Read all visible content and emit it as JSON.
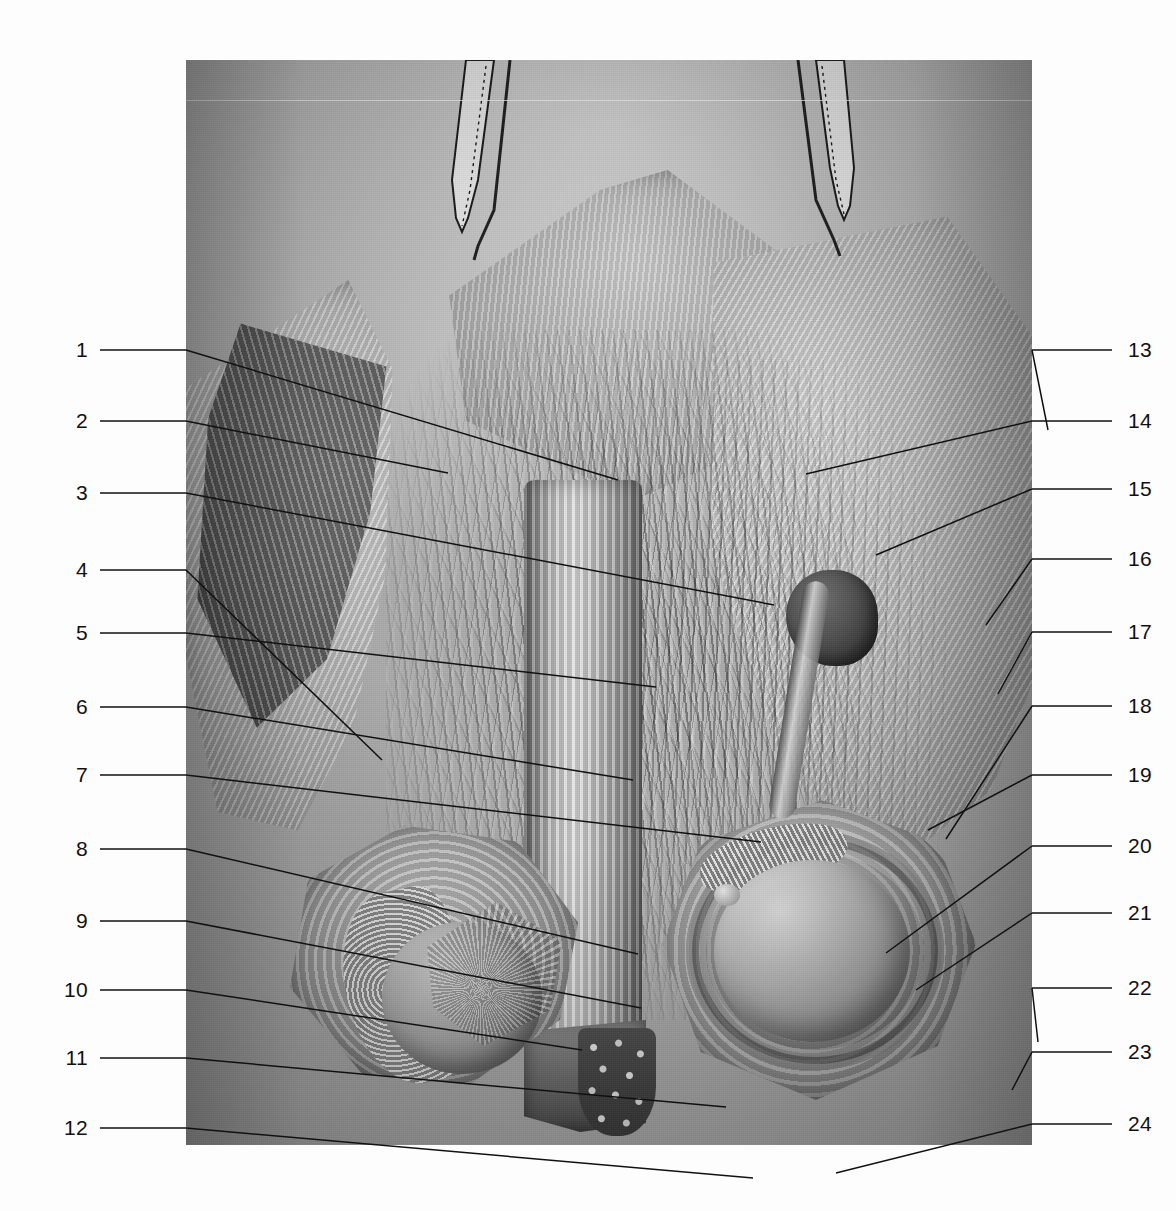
{
  "figure": {
    "frame": {
      "left": 186,
      "top": 60,
      "width": 846,
      "height": 1085
    },
    "background_color": "#b9b9b9",
    "page_background": "#fdfdfd",
    "line_color": "#111111"
  },
  "labels": {
    "left": [
      {
        "n": "1",
        "y": 350,
        "tip_x": 432,
        "tip_y": 420
      },
      {
        "n": "2",
        "y": 421,
        "tip_x": 262,
        "tip_y": 413
      },
      {
        "n": "3",
        "y": 493,
        "tip_x": 588,
        "tip_y": 545
      },
      {
        "n": "4",
        "y": 570,
        "tip_x": 196,
        "tip_y": 700
      },
      {
        "n": "5",
        "y": 633,
        "tip_x": 470,
        "tip_y": 627
      },
      {
        "n": "6",
        "y": 707,
        "tip_x": 447,
        "tip_y": 720
      },
      {
        "n": "7",
        "y": 775,
        "tip_x": 575,
        "tip_y": 782
      },
      {
        "n": "8",
        "y": 849,
        "tip_x": 452,
        "tip_y": 894
      },
      {
        "n": "9",
        "y": 921,
        "tip_x": 455,
        "tip_y": 948
      },
      {
        "n": "10",
        "y": 990,
        "tip_x": 396,
        "tip_y": 990
      },
      {
        "n": "11",
        "y": 1058,
        "tip_x": 540,
        "tip_y": 1047
      },
      {
        "n": "12",
        "y": 1128,
        "tip_x": 567,
        "tip_y": 1118
      }
    ],
    "right": [
      {
        "n": "13",
        "y": 350,
        "tip_x": 862,
        "tip_y": 370
      },
      {
        "n": "14",
        "y": 421,
        "tip_x": 620,
        "tip_y": 414
      },
      {
        "n": "15",
        "y": 489,
        "tip_x": 690,
        "tip_y": 495
      },
      {
        "n": "16",
        "y": 559,
        "tip_x": 800,
        "tip_y": 565
      },
      {
        "n": "17",
        "y": 632,
        "tip_x": 812,
        "tip_y": 634
      },
      {
        "n": "18",
        "y": 706,
        "tip_x": 760,
        "tip_y": 779
      },
      {
        "n": "19",
        "y": 775,
        "tip_x": 742,
        "tip_y": 770
      },
      {
        "n": "20",
        "y": 846,
        "tip_x": 700,
        "tip_y": 893
      },
      {
        "n": "21",
        "y": 913,
        "tip_x": 730,
        "tip_y": 930
      },
      {
        "n": "22",
        "y": 988,
        "tip_x": 852,
        "tip_y": 982
      },
      {
        "n": "23",
        "y": 1052,
        "tip_x": 826,
        "tip_y": 1030
      },
      {
        "n": "24",
        "y": 1124,
        "tip_x": 650,
        "tip_y": 1113
      }
    ],
    "left_number_x": 88,
    "left_line_start_x": 100,
    "right_number_x": 1128,
    "right_line_end_x": 1112
  },
  "instruments": [
    {
      "name": "forceps-left",
      "x": 398,
      "y": 60,
      "label": "toothed forceps"
    },
    {
      "name": "forceps-right",
      "x": 790,
      "y": 60,
      "label": "toothed forceps"
    }
  ],
  "structures": [
    {
      "name": "flap-left",
      "label": "reflected skin flap, left"
    },
    {
      "name": "flap-right",
      "label": "reflected skin flap, right"
    },
    {
      "name": "cord-vessels",
      "label": "spermatic cord vessel plexus"
    },
    {
      "name": "penis-shaft",
      "label": "penile shaft"
    },
    {
      "name": "penis-cross-section",
      "label": "penile cross-section"
    },
    {
      "name": "testis-left",
      "label": "left testis"
    },
    {
      "name": "epididymis-left",
      "label": "left epididymis"
    },
    {
      "name": "testis-right",
      "label": "right testis"
    },
    {
      "name": "tunica-vaginalis-right",
      "label": "right tunica vaginalis"
    },
    {
      "name": "hernia-sac",
      "label": "dark sac-like structure"
    }
  ]
}
